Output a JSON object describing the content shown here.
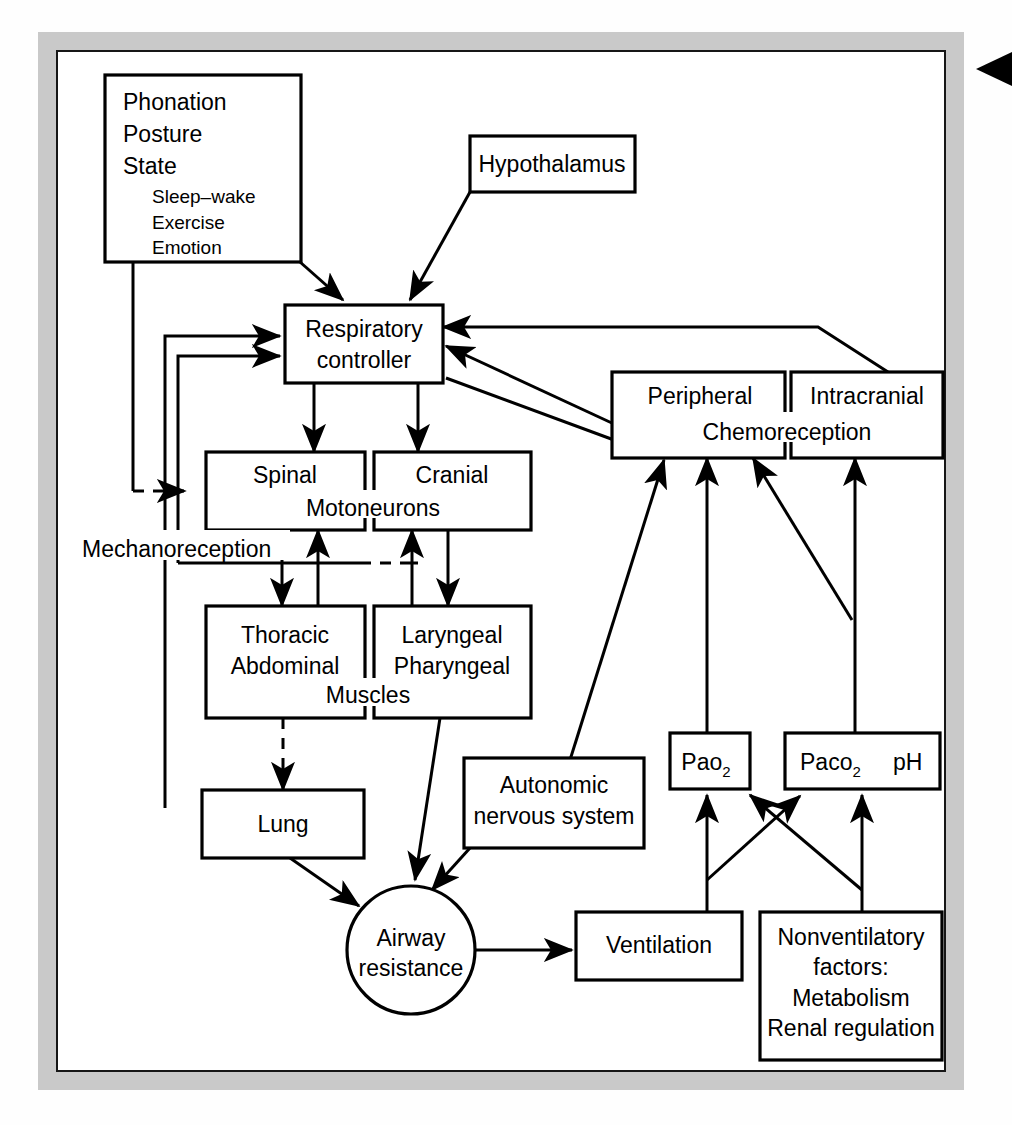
{
  "figure": {
    "edge_marker": "black-triangle-page-marker"
  },
  "nodes": {
    "phonation": {
      "lines": [
        "Phonation",
        "Posture",
        "State"
      ],
      "sub_lines": [
        "Sleep–wake",
        "Exercise",
        "Emotion"
      ]
    },
    "hypothalamus": {
      "label": "Hypothalamus"
    },
    "respiratory_controller": {
      "line1": "Respiratory",
      "line2": "controller"
    },
    "peripheral": {
      "label": "Peripheral"
    },
    "intracranial": {
      "label": "Intracranial"
    },
    "chemoreception": {
      "label": "Chemoreception"
    },
    "spinal": {
      "label": "Spinal"
    },
    "cranial": {
      "label": "Cranial"
    },
    "motoneurons": {
      "label": "Motoneurons"
    },
    "thoracic": {
      "line1": "Thoracic",
      "line2": "Abdominal"
    },
    "laryngeal": {
      "line1": "Laryngeal",
      "line2": "Pharyngeal"
    },
    "muscles": {
      "label": "Muscles"
    },
    "lung": {
      "label": "Lung"
    },
    "autonomic": {
      "line1": "Autonomic",
      "line2": "nervous system"
    },
    "airway": {
      "line1": "Airway",
      "line2": "resistance"
    },
    "ventilation": {
      "label": "Ventilation"
    },
    "pao2": {
      "base": "Pao",
      "sub": "2"
    },
    "paco2": {
      "base": "Paco",
      "sub": "2",
      "ph": "pH"
    },
    "nonventilatory": {
      "line1": "Nonventilatory",
      "line2": "factors:",
      "line3": "Metabolism",
      "line4": "Renal regulation"
    }
  },
  "labels": {
    "mechanoreception": "Mechanoreception"
  },
  "colors": {
    "stroke": "#000000",
    "box_fill": "#ffffff",
    "page_grey": "#c9c9c9",
    "panel_white": "#ffffff"
  }
}
